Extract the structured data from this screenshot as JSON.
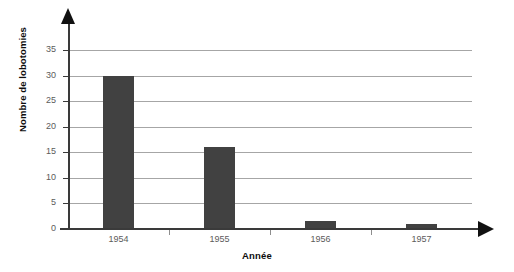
{
  "chart_data": {
    "type": "bar",
    "title": "",
    "categories": [
      "1954",
      "1955",
      "1956",
      "1957"
    ],
    "values": [
      30,
      16,
      1.5,
      1
    ],
    "series": [
      {
        "name": "Nombre de lobotomies",
        "values": [
          30,
          16,
          1.5,
          1
        ]
      }
    ],
    "xlabel": "Année",
    "ylabel": "Nombre de lobotomies",
    "ylim": [
      0,
      37
    ],
    "yticks": [
      0,
      5,
      10,
      15,
      20,
      25,
      30,
      35
    ],
    "ytick_labels": [
      "0",
      "5",
      "10",
      "15",
      "20",
      "25",
      "30",
      "35"
    ],
    "grid": "horizontal",
    "legend": "none",
    "bar_color": "#414141",
    "grid_color": "#a6a6a6",
    "axis_color": "#3a3a3a",
    "tick_label_color": "#5b5b5b",
    "background": "#ffffff"
  }
}
